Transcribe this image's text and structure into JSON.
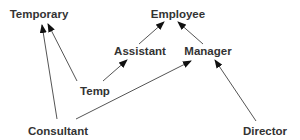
{
  "diagram": {
    "type": "class-hierarchy",
    "colors": {
      "text": "#333333",
      "edge": "#555555",
      "arrowhead": "#111111",
      "background": "#ffffff"
    },
    "nodes": [
      {
        "id": "temporary",
        "label": "Temporary",
        "x": 39,
        "y": 18
      },
      {
        "id": "employee",
        "label": "Employee",
        "x": 178,
        "y": 18
      },
      {
        "id": "assistant",
        "label": "Assistant",
        "x": 140,
        "y": 55
      },
      {
        "id": "manager",
        "label": "Manager",
        "x": 208,
        "y": 55
      },
      {
        "id": "temp",
        "label": "Temp",
        "x": 95,
        "y": 95
      },
      {
        "id": "consultant",
        "label": "Consultant",
        "x": 58,
        "y": 135
      },
      {
        "id": "director",
        "label": "Director",
        "x": 265,
        "y": 135
      }
    ],
    "edges": [
      {
        "from": "temp",
        "to": "temporary",
        "x1": 77,
        "y1": 81,
        "x2": 48,
        "y2": 24
      },
      {
        "from": "consultant",
        "to": "temporary",
        "x1": 57,
        "y1": 119,
        "x2": 42,
        "y2": 25
      },
      {
        "from": "temp",
        "to": "assistant",
        "x1": 103,
        "y1": 81,
        "x2": 127,
        "y2": 60
      },
      {
        "from": "assistant",
        "to": "employee",
        "x1": 139,
        "y1": 44,
        "x2": 164,
        "y2": 22
      },
      {
        "from": "manager",
        "to": "employee",
        "x1": 203,
        "y1": 44,
        "x2": 178,
        "y2": 22
      },
      {
        "from": "consultant",
        "to": "manager",
        "x1": 76,
        "y1": 119,
        "x2": 191,
        "y2": 61
      },
      {
        "from": "director",
        "to": "manager",
        "x1": 256,
        "y1": 121,
        "x2": 215,
        "y2": 60
      }
    ]
  }
}
